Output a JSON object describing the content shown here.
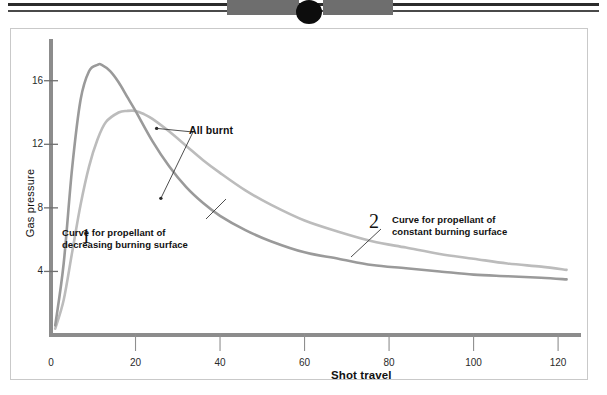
{
  "figure": {
    "artifact": {
      "name": "scan-edge-artifact"
    }
  },
  "chart_data": {
    "type": "line",
    "title": "",
    "subtitle": "",
    "xlabel": "Shot travel",
    "ylabel": "Gas pressure",
    "xlim": [
      0,
      124
    ],
    "ylim": [
      0,
      18.5
    ],
    "xticks": [
      0,
      20,
      40,
      60,
      80,
      100,
      120
    ],
    "xtick_labels": [
      "0",
      "20",
      "40",
      "60",
      "80",
      "100",
      "120"
    ],
    "yticks": [
      4,
      8,
      12,
      16
    ],
    "ytick_labels": [
      "4",
      "8",
      "12",
      "16"
    ],
    "grid": false,
    "legend_position": "inline-annotations",
    "series": [
      {
        "name": "Curve for propellant of decreasing burning surface",
        "number": "1",
        "color": "#9a9a9a",
        "x": [
          1,
          3,
          5,
          7,
          9,
          11,
          12,
          14,
          16,
          18,
          20,
          24,
          28,
          32,
          36,
          40,
          46,
          52,
          60,
          68,
          76,
          84,
          92,
          100,
          108,
          116,
          122
        ],
        "y": [
          0.6,
          4.5,
          10.5,
          14.8,
          16.6,
          17.0,
          17.0,
          16.6,
          15.9,
          15.0,
          14.1,
          12.2,
          10.6,
          9.3,
          8.3,
          7.5,
          6.6,
          5.9,
          5.2,
          4.8,
          4.4,
          4.2,
          4.0,
          3.8,
          3.7,
          3.6,
          3.5
        ]
      },
      {
        "name": "Curve for propellant of constant burning surface",
        "number": "2",
        "color": "#bcbcbc",
        "x": [
          1,
          3,
          5,
          7,
          9,
          11,
          13,
          16,
          18,
          20,
          22,
          24,
          28,
          32,
          36,
          40,
          46,
          52,
          60,
          68,
          76,
          84,
          92,
          100,
          108,
          116,
          122
        ],
        "y": [
          0.4,
          2.2,
          5.2,
          8.2,
          10.6,
          12.3,
          13.4,
          14.0,
          14.1,
          14.1,
          13.9,
          13.6,
          12.8,
          11.9,
          11.0,
          10.2,
          9.1,
          8.2,
          7.2,
          6.5,
          5.9,
          5.5,
          5.1,
          4.8,
          4.5,
          4.3,
          4.1
        ]
      }
    ],
    "annotations": [
      {
        "name": "all-burnt",
        "text": "All burnt",
        "points_to": [
          {
            "x": 25,
            "y": 13.0
          },
          {
            "x": 26,
            "y": 8.6
          }
        ]
      },
      {
        "name": "curve-1-note",
        "number": "1",
        "line1": "Curve for propellant of",
        "line2": "decreasing burning surface"
      },
      {
        "name": "curve-2-note",
        "number": "2",
        "line1": "Curve for propellant of",
        "line2": "constant burning surface"
      }
    ]
  }
}
